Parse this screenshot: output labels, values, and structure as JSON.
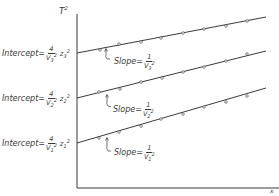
{
  "diagram": {
    "y_axis_label": "T",
    "y_axis_exp": "2",
    "x_axis_label": "x",
    "lines": [
      {
        "id": "layer3",
        "intercept_prefix": "Intercept",
        "intercept_eq": "=",
        "intercept_num": "4",
        "intercept_den_base": "V",
        "intercept_den_sup": "2",
        "intercept_den_sub": "3",
        "intercept_z": "z",
        "intercept_z_sup": "2",
        "intercept_z_sub": "3",
        "slope_prefix": "Slope",
        "slope_eq": "=",
        "slope_num": "1",
        "slope_den_base": "V",
        "slope_den_sup": "2",
        "slope_den_sub": "3",
        "x1": 77,
        "y1": 53,
        "x2": 266,
        "y2": 17,
        "points": [
          [
            100,
            50
          ],
          [
            119,
            44
          ],
          [
            141,
            42
          ],
          [
            161,
            38
          ],
          [
            183,
            33
          ],
          [
            204,
            29
          ],
          [
            226,
            26
          ],
          [
            247,
            21
          ]
        ]
      },
      {
        "id": "layer2",
        "intercept_prefix": "Intercept",
        "intercept_eq": "=",
        "intercept_num": "4",
        "intercept_den_base": "V",
        "intercept_den_sup": "2",
        "intercept_den_sub": "2",
        "intercept_z": "z",
        "intercept_z_sup": "2",
        "intercept_z_sub": "2",
        "slope_prefix": "Slope",
        "slope_eq": "=",
        "slope_num": "1",
        "slope_den_base": "V",
        "slope_den_sup": "2",
        "slope_den_sub": "2",
        "x1": 77,
        "y1": 98,
        "x2": 266,
        "y2": 51,
        "points": [
          [
            99,
            92
          ],
          [
            120,
            89
          ],
          [
            141,
            82
          ],
          [
            162,
            78
          ],
          [
            183,
            72
          ],
          [
            204,
            67
          ],
          [
            226,
            61
          ],
          [
            247,
            54
          ]
        ]
      },
      {
        "id": "layer1",
        "intercept_prefix": "Intercept",
        "intercept_eq": "=",
        "intercept_num": "4",
        "intercept_den_base": "V",
        "intercept_den_sup": "2",
        "intercept_den_sub": "1",
        "intercept_z": "z",
        "intercept_z_sup": "2",
        "intercept_z_sub": "1",
        "slope_prefix": "Slope",
        "slope_eq": "=",
        "slope_num": "1",
        "slope_den_base": "V",
        "slope_den_sup": "2",
        "slope_den_sub": "1",
        "x1": 77,
        "y1": 143,
        "x2": 266,
        "y2": 88,
        "points": [
          [
            99,
            138
          ],
          [
            119,
            132
          ],
          [
            141,
            126
          ],
          [
            161,
            119
          ],
          [
            183,
            114
          ],
          [
            204,
            107
          ],
          [
            226,
            102
          ],
          [
            247,
            96
          ]
        ]
      }
    ],
    "colors": {
      "ink": "#3a3a3a",
      "background": "#ffffff"
    }
  }
}
